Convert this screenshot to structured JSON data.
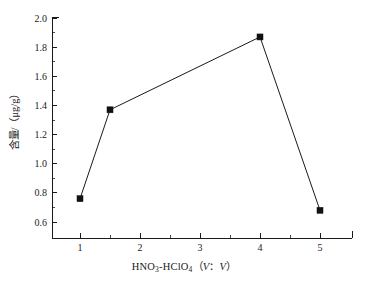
{
  "chart_data": {
    "type": "line",
    "title": "",
    "subtitle": "",
    "xlabel": "HNO3-HClO4 (V : V)",
    "ylabel": "含量/（μg/g）",
    "x": [
      1,
      1.5,
      4,
      5
    ],
    "values": [
      0.76,
      1.37,
      1.87,
      0.68
    ],
    "series": [
      {
        "name": "含量",
        "x": [
          1,
          1.5,
          4,
          5
        ],
        "values": [
          0.76,
          1.37,
          1.87,
          0.68
        ]
      }
    ],
    "xlim": [
      0.55,
      5.5
    ],
    "ylim": [
      0.52,
      2.0
    ],
    "xticks": [
      1,
      2,
      3,
      4,
      5
    ],
    "xtick_labels": [
      "1",
      "2",
      "3",
      "4",
      "5"
    ],
    "yticks": [
      0.6,
      0.8,
      1.0,
      1.2,
      1.4,
      1.6,
      1.8,
      2.0
    ],
    "ytick_labels": [
      "0.6",
      "0.8",
      "1.0",
      "1.2",
      "1.4",
      "1.6",
      "1.8",
      "2.0"
    ],
    "x_minor_interval": 0.5,
    "y_minor_interval": 0.1,
    "grid": false,
    "legend": false,
    "legend_position": "none",
    "marker": "square",
    "marker_color": "#111111",
    "line_color": "#1a1a1a",
    "background_color": "#ffffff",
    "axis_color": "#1a1a1a"
  },
  "axis_titles": {
    "x_main": "HNO",
    "x_sub_1": "3",
    "x_mid": "-HClO",
    "x_sub_2": "4",
    "x_paren_open": "（",
    "x_v1": "V",
    "x_colon": "：",
    "x_v2": "V",
    "x_paren_close": "）",
    "y_full": "含量/（μg/g）"
  }
}
